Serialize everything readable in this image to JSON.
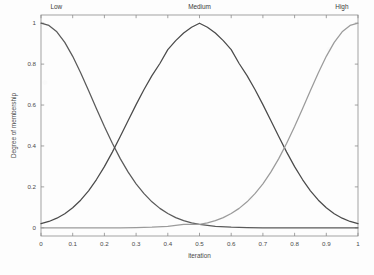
{
  "chart_data": {
    "type": "line",
    "title": "",
    "xlabel": "iteration",
    "ylabel": "Degree of membership",
    "xlim": [
      0,
      1
    ],
    "ylim": [
      -0.04,
      1.04
    ],
    "grid": false,
    "legend_position": "inside-top (inline curve labels)",
    "xticks": [
      "0",
      "0.1",
      "0.2",
      "0.3",
      "0.4",
      "0.5",
      "0.6",
      "0.7",
      "0.8",
      "0.9",
      "1"
    ],
    "xtick_values": [
      0,
      0.1,
      0.2,
      0.3,
      0.4,
      0.5,
      0.6,
      0.7,
      0.8,
      0.9,
      1
    ],
    "yticks": [
      "0",
      "0.2",
      "0.4",
      "0.6",
      "0.8",
      "1"
    ],
    "ytick_values": [
      0,
      0.2,
      0.4,
      0.6,
      0.8,
      1
    ],
    "annotations": [
      {
        "text": "Low",
        "x": 0.03,
        "y": 1.07,
        "anchor": "start"
      },
      {
        "text": "Medium",
        "x": 0.5,
        "y": 1.07,
        "anchor": "middle"
      },
      {
        "text": "High",
        "x": 0.97,
        "y": 1.07,
        "anchor": "end"
      }
    ],
    "series": [
      {
        "name": "Low",
        "color": "#5a5a5a",
        "type": "gaussmf",
        "params": {
          "mean": 0.0,
          "sigma": 0.17
        },
        "x": [
          0,
          0.025,
          0.05,
          0.075,
          0.1,
          0.125,
          0.15,
          0.175,
          0.2,
          0.225,
          0.25,
          0.275,
          0.3,
          0.325,
          0.35,
          0.375,
          0.4,
          0.425,
          0.45,
          0.475,
          0.5,
          0.55,
          0.6,
          0.65,
          0.7,
          0.75,
          0.8,
          0.85,
          0.9,
          0.95,
          1
        ],
        "values": [
          1,
          0.989,
          0.958,
          0.906,
          0.838,
          0.758,
          0.671,
          0.582,
          0.495,
          0.413,
          0.338,
          0.272,
          0.215,
          0.167,
          0.127,
          0.095,
          0.07,
          0.05,
          0.035,
          0.024,
          0.017,
          0.007,
          0.003,
          0.001,
          0,
          0,
          0,
          0,
          0,
          0,
          0
        ]
      },
      {
        "name": "Medium",
        "color": "#4a4a4a",
        "type": "gaussmf",
        "params": {
          "mean": 0.5,
          "sigma": 0.17
        },
        "x": [
          0,
          0.025,
          0.05,
          0.075,
          0.1,
          0.125,
          0.15,
          0.175,
          0.2,
          0.225,
          0.25,
          0.275,
          0.3,
          0.325,
          0.35,
          0.375,
          0.4,
          0.425,
          0.45,
          0.475,
          0.5,
          0.525,
          0.55,
          0.575,
          0.6,
          0.625,
          0.65,
          0.675,
          0.7,
          0.725,
          0.75,
          0.775,
          0.8,
          0.825,
          0.85,
          0.875,
          0.9,
          0.925,
          0.95,
          0.975,
          1
        ],
        "values": [
          0.02,
          0.031,
          0.047,
          0.069,
          0.098,
          0.135,
          0.181,
          0.236,
          0.299,
          0.37,
          0.446,
          0.524,
          0.602,
          0.676,
          0.744,
          0.803,
          0.871,
          0.915,
          0.952,
          0.98,
          1.0,
          0.98,
          0.952,
          0.915,
          0.871,
          0.803,
          0.744,
          0.676,
          0.602,
          0.524,
          0.446,
          0.37,
          0.299,
          0.236,
          0.181,
          0.135,
          0.098,
          0.069,
          0.047,
          0.031,
          0.02
        ]
      },
      {
        "name": "High",
        "color": "#9b9b9b",
        "type": "gaussmf",
        "params": {
          "mean": 1.0,
          "sigma": 0.17
        },
        "x": [
          0,
          0.05,
          0.1,
          0.15,
          0.2,
          0.25,
          0.3,
          0.35,
          0.4,
          0.45,
          0.5,
          0.525,
          0.55,
          0.575,
          0.6,
          0.625,
          0.65,
          0.675,
          0.7,
          0.725,
          0.75,
          0.775,
          0.8,
          0.825,
          0.85,
          0.875,
          0.9,
          0.925,
          0.95,
          0.975,
          1
        ],
        "values": [
          0,
          0,
          0,
          0,
          0,
          0,
          0.001,
          0.003,
          0.007,
          0.017,
          0.017,
          0.024,
          0.035,
          0.05,
          0.07,
          0.095,
          0.127,
          0.167,
          0.215,
          0.272,
          0.338,
          0.413,
          0.495,
          0.582,
          0.671,
          0.758,
          0.838,
          0.906,
          0.958,
          0.989,
          1
        ]
      }
    ]
  }
}
